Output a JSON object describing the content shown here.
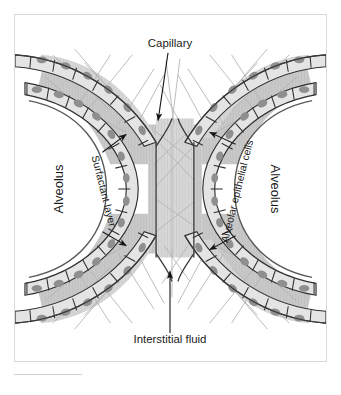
{
  "figure": {
    "style": "grayscale histological schematic",
    "colors": {
      "background": "#ffffff",
      "frame_border": "#d9d9d9",
      "interstitium_fill": "#c9c9c9",
      "capillary_lumen": "#d6d6d6",
      "cell_fill": "#e4e4e4",
      "nucleus_fill": "#8f8f8f",
      "outline": "#3a3a3a",
      "fiber": "#b0b0b0",
      "label_text": "#1a1a1a"
    },
    "labels": [
      {
        "id": "capillary",
        "text": "Capillary",
        "position": "top-center",
        "rotation": 0,
        "arrows": 1
      },
      {
        "id": "interstitial",
        "text": "Interstitial fluid",
        "position": "bottom-center",
        "rotation": 0,
        "arrows": 1
      },
      {
        "id": "alveolus-left",
        "text": "Alveolus",
        "position": "left-center",
        "rotation": -90,
        "arrows": 0
      },
      {
        "id": "alveolus-right",
        "text": "Alveolus",
        "position": "right-center",
        "rotation": 90,
        "arrows": 0
      },
      {
        "id": "surfactant",
        "text": "Surfactant layer",
        "position": "left-inner",
        "rotation": 78,
        "arrows": 2
      },
      {
        "id": "epithelial-cells",
        "text": "Alveolar epithelial cells",
        "position": "right-inner",
        "rotation": -76,
        "arrows": 2
      }
    ],
    "structures": [
      {
        "id": "central-capillary",
        "name": "Central capillary channel"
      },
      {
        "id": "branch-nw",
        "name": "Northwest capillary branch"
      },
      {
        "id": "branch-ne",
        "name": "Northeast capillary branch"
      },
      {
        "id": "branch-sw",
        "name": "Southwest capillary branch"
      },
      {
        "id": "branch-se",
        "name": "Southeast capillary branch"
      },
      {
        "id": "alveolar-space-left",
        "name": "Left alveolar air space"
      },
      {
        "id": "alveolar-space-right",
        "name": "Right alveolar air space"
      }
    ]
  }
}
